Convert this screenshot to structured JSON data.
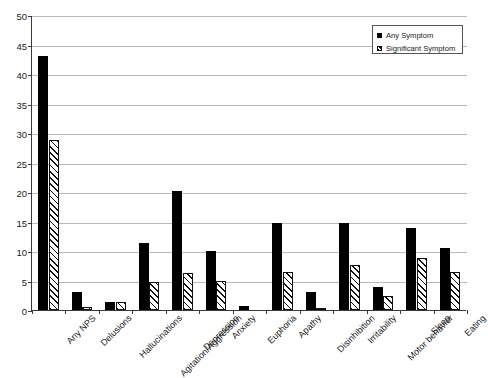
{
  "chart_data": {
    "type": "bar",
    "title": "",
    "xlabel": "",
    "ylabel": "",
    "ylim": [
      0,
      50
    ],
    "ytick_step": 5,
    "yticks": [
      0,
      5,
      10,
      15,
      20,
      25,
      30,
      35,
      40,
      45,
      50
    ],
    "grid": "horizontal",
    "legend_position": "top-right",
    "categories": [
      "Any NPS",
      "Delusions",
      "Hallucinations",
      "Agitation/Aggression",
      "Depression",
      "Anxiety",
      "Euphoria",
      "Apathy",
      "Disinhibition",
      "Irritability",
      "Motor behavior",
      "Sleep",
      "Eating"
    ],
    "series": [
      {
        "name": "Any Symptom",
        "style": "solid-black",
        "color": "#000000",
        "values": [
          43.0,
          3.0,
          1.3,
          11.3,
          20.1,
          10.0,
          0.6,
          14.8,
          3.1,
          14.8,
          3.9,
          13.9,
          10.5
        ]
      },
      {
        "name": "Significant Symptom",
        "style": "diagonal-hatch",
        "color": "#ffffff",
        "values": [
          28.8,
          0.5,
          1.4,
          4.7,
          6.3,
          5.0,
          0.0,
          6.4,
          0.4,
          7.6,
          2.3,
          8.9,
          6.4
        ]
      }
    ]
  },
  "legend": {
    "items": [
      {
        "label": "Any Symptom",
        "swatch": "solid-square-icon"
      },
      {
        "label": "Significant Symptom",
        "swatch": "hatched-square-icon"
      }
    ]
  },
  "title_remnant": {
    "text": ""
  }
}
